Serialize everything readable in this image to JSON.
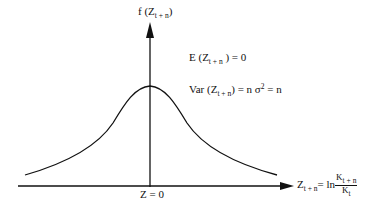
{
  "diagram": {
    "type": "probability-density-curve",
    "y_axis": {
      "label_func": "f",
      "label_var": "Z",
      "label_sub": "t + n"
    },
    "x_axis": {
      "origin_label": "Z = 0",
      "label_var": "Z",
      "label_sub": "t + n",
      "equals": "= ln",
      "frac_num": "K",
      "frac_num_sub": "t + n",
      "frac_den": "K",
      "frac_den_sub": "t"
    },
    "annotations": {
      "expectation": {
        "prefix": "E (Z",
        "sub": "t + n",
        "suffix": " ) = 0"
      },
      "variance": {
        "prefix": "Var (Z",
        "sub": "t + n",
        "mid": ") = n σ",
        "sup": "2",
        "suffix": " = n"
      }
    },
    "curve": {
      "shape": "bell",
      "peak_x": 150,
      "peak_y": 86,
      "left_tail": [
        25,
        175
      ],
      "right_tail": [
        277,
        175
      ]
    },
    "colors": {
      "stroke": "#111111",
      "background": "#ffffff"
    }
  }
}
